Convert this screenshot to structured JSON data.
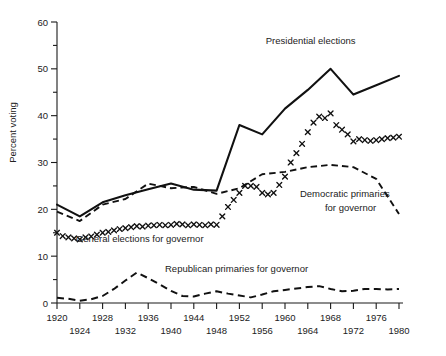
{
  "chart_data": {
    "type": "line",
    "title": "",
    "xlabel": "",
    "ylabel": "Percent voting",
    "xlim": [
      1920,
      1980
    ],
    "ylim": [
      0,
      60
    ],
    "grid": false,
    "legend_position": "inline-annotations",
    "y_ticks": [
      0,
      10,
      20,
      30,
      40,
      50,
      60
    ],
    "y_tick_labels": [
      "0",
      "10",
      "20",
      "30",
      "40",
      "50",
      "60"
    ],
    "y_minor_ticks": [
      5,
      15,
      25,
      35,
      45,
      55
    ],
    "x_ticks": [
      1920,
      1924,
      1928,
      1932,
      1936,
      1940,
      1944,
      1948,
      1952,
      1956,
      1960,
      1964,
      1968,
      1972,
      1976,
      1980
    ],
    "x_tick_labels_row1": [
      "1920",
      "1928",
      "1936",
      "1944",
      "1952",
      "1960",
      "1968",
      "1976"
    ],
    "x_tick_labels_row2": [
      "1924",
      "1932",
      "1940",
      "1948",
      "1956",
      "1964",
      "1972",
      "1980"
    ],
    "series": [
      {
        "name": "Presidential elections",
        "style": "solid",
        "label_x": 1965,
        "label_y": 55,
        "x": [
          1920,
          1924,
          1928,
          1932,
          1936,
          1940,
          1944,
          1948,
          1952,
          1956,
          1960,
          1964,
          1968,
          1972,
          1976,
          1980
        ],
        "values": [
          21.0,
          18.5,
          21.5,
          23.0,
          24.3,
          25.5,
          24.2,
          24.0,
          38.0,
          36.0,
          41.5,
          45.5,
          50.0,
          44.5,
          46.5,
          48.5
        ]
      },
      {
        "name": "Democratic primaries for governor",
        "style": "x-markers",
        "label_x": 1969,
        "label_y": 22.5,
        "x": [
          1920,
          1921,
          1922,
          1923,
          1924,
          1925,
          1926,
          1927,
          1928,
          1929,
          1930,
          1931,
          1932,
          1933,
          1934,
          1935,
          1936,
          1937,
          1938,
          1939,
          1940,
          1941,
          1942,
          1943,
          1944,
          1945,
          1946,
          1947,
          1948,
          1949,
          1950,
          1951,
          1952,
          1953,
          1954,
          1955,
          1956,
          1957,
          1958,
          1959,
          1960,
          1961,
          1962,
          1963,
          1964,
          1965,
          1966,
          1967,
          1968,
          1969,
          1970,
          1971,
          1972,
          1973,
          1974,
          1975,
          1976,
          1977,
          1978,
          1979,
          1980
        ],
        "values": [
          15.0,
          14.3,
          14.0,
          13.8,
          13.6,
          14.0,
          14.2,
          14.6,
          15.0,
          15.2,
          15.5,
          15.8,
          16.0,
          16.2,
          16.4,
          16.3,
          16.5,
          16.6,
          16.7,
          16.6,
          16.7,
          16.9,
          16.8,
          16.6,
          16.8,
          16.7,
          16.6,
          16.8,
          16.7,
          18.5,
          20.5,
          22.0,
          23.5,
          25.0,
          25.0,
          24.8,
          23.5,
          23.2,
          23.5,
          25.2,
          27.0,
          30.0,
          32.0,
          34.0,
          36.5,
          38.5,
          39.8,
          39.5,
          40.5,
          38.0,
          37.0,
          36.0,
          34.5,
          35.0,
          34.8,
          34.6,
          34.8,
          35.0,
          35.2,
          35.3,
          35.5
        ]
      },
      {
        "name": "General elections for governor",
        "style": "dashed",
        "label_x": 1933,
        "label_y": 13.2,
        "x": [
          1920,
          1924,
          1928,
          1932,
          1936,
          1940,
          1944,
          1948,
          1952,
          1956,
          1960,
          1964,
          1968,
          1972,
          1976,
          1980
        ],
        "values": [
          19.5,
          17.5,
          21.0,
          22.2,
          25.5,
          24.5,
          24.8,
          23.3,
          24.5,
          27.5,
          28.0,
          29.0,
          29.5,
          29.0,
          26.5,
          19.0
        ]
      },
      {
        "name": "Republican primaries for governor",
        "style": "dashed",
        "label_x": 1950,
        "label_y": 6.5,
        "x": [
          1920,
          1922,
          1924,
          1926,
          1928,
          1930,
          1932,
          1934,
          1936,
          1938,
          1940,
          1942,
          1944,
          1946,
          1948,
          1950,
          1952,
          1954,
          1956,
          1958,
          1960,
          1962,
          1964,
          1966,
          1968,
          1970,
          1972,
          1974,
          1976,
          1978,
          1980
        ],
        "values": [
          1.1,
          0.9,
          0.5,
          0.8,
          1.5,
          3.0,
          4.8,
          6.5,
          5.3,
          4.0,
          2.6,
          1.5,
          1.4,
          2.0,
          2.5,
          2.0,
          1.6,
          1.2,
          1.8,
          2.5,
          2.8,
          3.1,
          3.4,
          3.6,
          3.0,
          2.5,
          2.6,
          3.0,
          3.0,
          2.9,
          3.0
        ]
      }
    ]
  },
  "annotations": {
    "presidential": "Presidential elections",
    "general": "General elections for governor",
    "democratic_line1": "Democratic primaries",
    "democratic_line2": "for governor",
    "republican": "Republican primaries for governor"
  }
}
